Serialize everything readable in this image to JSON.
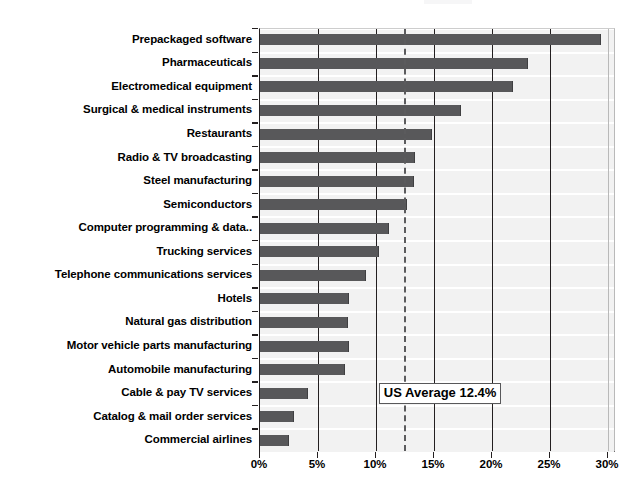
{
  "chart_data": {
    "type": "bar",
    "orientation": "horizontal",
    "title": "",
    "subtitle": "",
    "xlabel": "",
    "ylabel": "",
    "xlim": [
      0,
      30
    ],
    "xtick_values": [
      0,
      5,
      10,
      15,
      20,
      25,
      30
    ],
    "xtick_labels": [
      "0%",
      "5%",
      "10%",
      "15%",
      "20%",
      "25%",
      "30%"
    ],
    "grid": true,
    "grid_axis": "x",
    "legend": false,
    "units": "percent",
    "bar_color": "#58585a",
    "band_color": "#f2f2f2",
    "axis_color": "#231f20",
    "categories": [
      "Prepackaged software",
      "Pharmaceuticals",
      "Electromedical equipment",
      "Surgical & medical instruments",
      "Restaurants",
      "Radio & TV broadcasting",
      "Steel manufacturing",
      "Semiconductors",
      "Computer programming & data..",
      "Trucking services",
      "Telephone communications services",
      "Hotels",
      "Natural gas distribution",
      "Motor vehicle parts manufacturing",
      "Automobile manufacturing",
      "Cable & pay TV services",
      "Catalog & mail order services",
      "Commercial airlines"
    ],
    "values": [
      29.4,
      23.1,
      21.8,
      17.3,
      14.8,
      13.4,
      13.3,
      12.7,
      11.1,
      10.3,
      9.1,
      7.7,
      7.6,
      7.7,
      7.3,
      4.1,
      2.9,
      2.5
    ],
    "annotations": [
      {
        "name": "us-average",
        "label": "US Average 12.4%",
        "value": 12.4,
        "style": "dashed-vertical-line-with-boxed-label",
        "line_color": "#5b5b5d",
        "box_border_color": "#58585a"
      }
    ]
  }
}
